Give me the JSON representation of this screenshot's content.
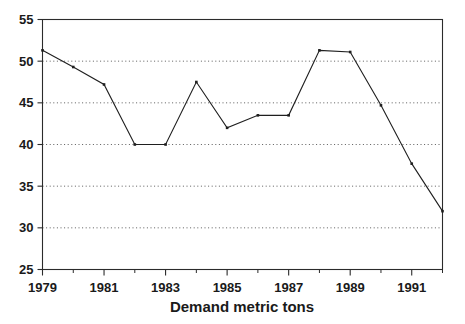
{
  "chart_data": {
    "type": "line",
    "title": "",
    "subtitle": "",
    "xlabel": "Demand metric tons",
    "ylabel": "",
    "x": [
      1979,
      1980,
      1981,
      1982,
      1983,
      1984,
      1985,
      1986,
      1987,
      1988,
      1989,
      1990,
      1991,
      1992
    ],
    "values": [
      51.3,
      49.3,
      47.2,
      40.0,
      40.0,
      47.5,
      42.0,
      43.5,
      43.5,
      51.3,
      51.1,
      44.7,
      37.7,
      32.0
    ],
    "series": [
      {
        "name": "Demand metric tons",
        "values": [
          51.3,
          49.3,
          47.2,
          40.0,
          40.0,
          47.5,
          42.0,
          43.5,
          43.5,
          51.3,
          51.1,
          44.7,
          37.7,
          32.0
        ]
      }
    ],
    "xlim": [
      1979,
      1992
    ],
    "ylim": [
      25,
      55
    ],
    "ytick_values": [
      25,
      30,
      35,
      40,
      45,
      50,
      55
    ],
    "ytick_labels": [
      "25",
      "30",
      "35",
      "40",
      "45",
      "50",
      "55"
    ],
    "xtick_values": [
      1979,
      1980,
      1981,
      1982,
      1983,
      1984,
      1985,
      1986,
      1987,
      1988,
      1989,
      1990,
      1991,
      1992
    ],
    "xtick_labeled": [
      1979,
      1981,
      1983,
      1985,
      1987,
      1989,
      1991
    ],
    "xtick_labels": [
      "1979",
      "1981",
      "1983",
      "1985",
      "1987",
      "1989",
      "1991"
    ],
    "grid": "horizontal-dotted",
    "legend": "none",
    "marker": "square",
    "line_color": "#1f1f1f",
    "grid_color": "#4a4a4a",
    "axis_color": "#2b2b2b",
    "background_color": "#ffffff",
    "annotations": []
  }
}
